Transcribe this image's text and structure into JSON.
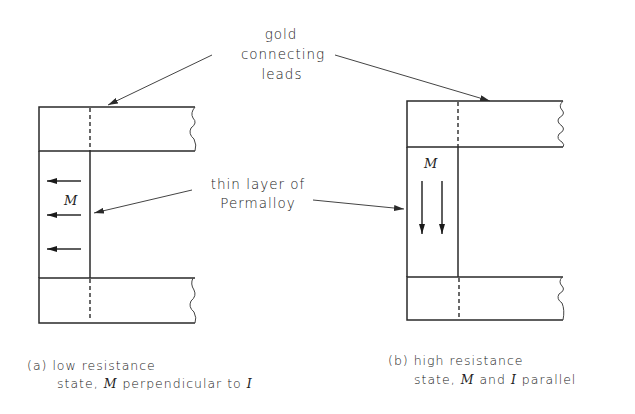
{
  "figure": {
    "labels": {
      "gold_leads": [
        "gold",
        "connecting",
        "leads"
      ],
      "permalloy": [
        "thin layer of",
        "Permalloy"
      ],
      "magnetization_symbol": "M",
      "current_symbol": "I"
    },
    "panel_a": {
      "caption_line1": "(a) low resistance",
      "caption_line2_pre": "state, ",
      "caption_line2_m": "M",
      "caption_line2_mid": " perpendicular to ",
      "caption_line2_i": "I",
      "arrow_direction": "left",
      "arrow_count": 3
    },
    "panel_b": {
      "caption_line1": "(b) high resistance",
      "caption_line2_pre": "state, ",
      "caption_line2_m": "M",
      "caption_line2_mid": " and ",
      "caption_line2_i": "I",
      "caption_line2_post": " parallel",
      "arrow_direction": "down",
      "arrow_count": 2
    },
    "colors": {
      "ink": "#2a2a2a",
      "background": "#ffffff"
    }
  }
}
